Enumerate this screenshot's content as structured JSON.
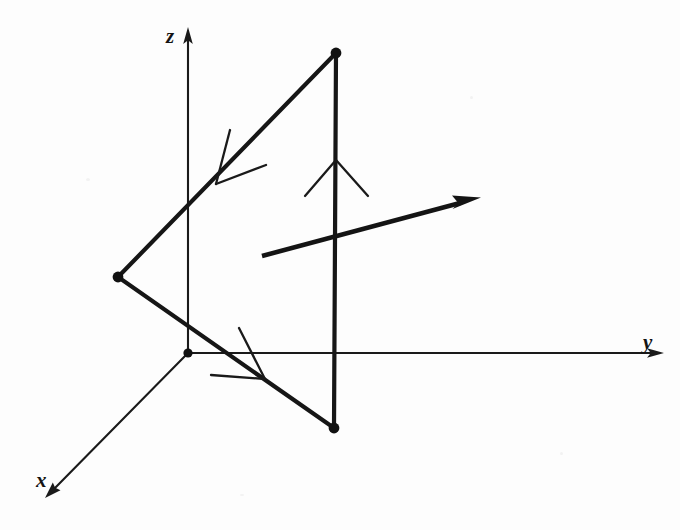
{
  "figure": {
    "background_color": "#fdfdfd",
    "ink_color": "#141414",
    "width": 680,
    "height": 530
  },
  "axes": {
    "origin": {
      "x": 188,
      "y": 353,
      "label": "origin",
      "dot_radius": 4.6
    },
    "items": [
      {
        "name": "z",
        "label": "z",
        "from": {
          "x": 188,
          "y": 353
        },
        "to": {
          "x": 188,
          "y": 30
        },
        "arrow": true,
        "label_pos": {
          "x": 166,
          "y": 26
        }
      },
      {
        "name": "y",
        "label": "y",
        "from": {
          "x": 188,
          "y": 353
        },
        "to": {
          "x": 662,
          "y": 353
        },
        "arrow": true,
        "label_pos": {
          "x": 643,
          "y": 332
        }
      },
      {
        "name": "x",
        "label": "x",
        "from": {
          "x": 188,
          "y": 353
        },
        "to": {
          "x": 46,
          "y": 497
        },
        "arrow": true,
        "label_pos": {
          "x": 36,
          "y": 470
        }
      }
    ]
  },
  "triangle": {
    "name": "surface-element",
    "vertices": [
      {
        "name": "top-vertex",
        "x": 336,
        "y": 53
      },
      {
        "name": "left-vertex",
        "x": 118,
        "y": 277
      },
      {
        "name": "bottom-vertex",
        "x": 334,
        "y": 428
      }
    ],
    "vertex_dot_radius": 5.4,
    "edges": [
      {
        "name": "edge-top-left",
        "from": 0,
        "to": 1
      },
      {
        "name": "edge-left-bottom",
        "from": 1,
        "to": 2
      },
      {
        "name": "edge-bottom-top",
        "from": 2,
        "to": 0
      }
    ],
    "direction_arrows": [
      {
        "name": "direction-arrow-upper-left",
        "tip": {
          "x": 216,
          "y": 184
        },
        "barb_a": {
          "x": 230,
          "y": 130
        },
        "barb_b": {
          "x": 266,
          "y": 165
        }
      },
      {
        "name": "direction-arrow-lower-left",
        "tip": {
          "x": 265,
          "y": 379
        },
        "barb_a": {
          "x": 239,
          "y": 328
        },
        "barb_b": {
          "x": 211,
          "y": 375
        }
      },
      {
        "name": "direction-arrow-right-edge",
        "tip": {
          "x": 336,
          "y": 160
        },
        "barb_a": {
          "x": 305,
          "y": 196
        },
        "barb_b": {
          "x": 368,
          "y": 196
        }
      }
    ]
  },
  "normal_vector": {
    "name": "normal-vector-arrow",
    "from": {
      "x": 262,
      "y": 256
    },
    "to": {
      "x": 480,
      "y": 198
    },
    "head_length": 26,
    "head_width": 13,
    "label": ""
  }
}
